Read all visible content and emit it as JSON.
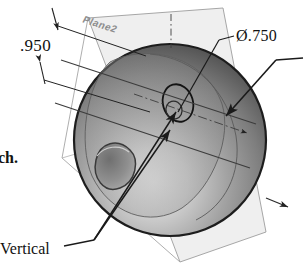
{
  "document": {
    "type": "cad-technical-illustration",
    "description": "Shaded sphere with reference plane, dimension and relation callouts"
  },
  "labels": {
    "dimension_height": ".950",
    "diameter_callout": "Ø.750",
    "relation_vertical": "Vertical",
    "plane_name": "Plane2",
    "clipped_body_text": "ch."
  },
  "colors": {
    "sphere_dark": "#4a4a4a",
    "sphere_mid": "#8e8e8e",
    "sphere_light": "#d9d9d9",
    "sphere_outline": "#1d1d1d",
    "plane_fill": "#e9e9e9",
    "plane_stroke": "#9a9a9a",
    "plane_label": "#8d8d8d",
    "leader_line": "#1a1a1a",
    "dimension_line": "#222222",
    "text": "#111111",
    "page_background": "#ffffff"
  },
  "geometry": {
    "sphere": {
      "center_x": 170,
      "center_y": 140,
      "radius": 96
    },
    "center_hole": {
      "cx": 178,
      "cy": 103,
      "rx": 15,
      "ry": 19
    },
    "dimple": {
      "cx": 113,
      "cy": 168,
      "rx": 20,
      "ry": 16
    }
  },
  "annotations": [
    {
      "name": "height-dimension",
      "value": ".950",
      "kind": "linear-dimension"
    },
    {
      "name": "diameter-dimension",
      "value": "Ø.750",
      "kind": "diameter-callout"
    },
    {
      "name": "vertical-relation",
      "value": "Vertical",
      "kind": "geometric-relation"
    },
    {
      "name": "plane-reference",
      "value": "Plane2",
      "kind": "datum-plane"
    }
  ]
}
